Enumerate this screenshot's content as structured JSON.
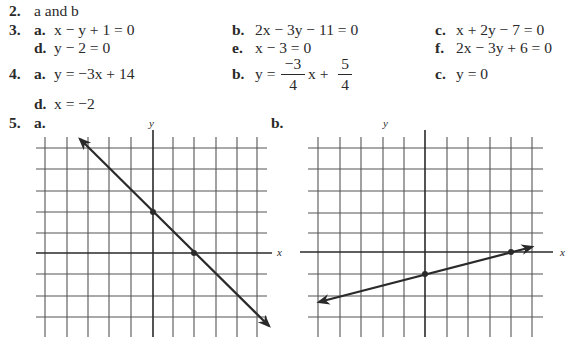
{
  "answers": {
    "q2": {
      "number": "2.",
      "text": "a and b"
    },
    "q3": {
      "number": "3.",
      "items": [
        {
          "label": "a.",
          "eq": "x − y + 1 = 0"
        },
        {
          "label": "b.",
          "eq": "2x − 3y − 11 = 0"
        },
        {
          "label": "c.",
          "eq": "x + 2y − 7 = 0"
        },
        {
          "label": "d.",
          "eq": "y − 2 = 0"
        },
        {
          "label": "e.",
          "eq": "x − 3 = 0"
        },
        {
          "label": "f.",
          "eq": "2x − 3y + 6 = 0"
        }
      ]
    },
    "q4": {
      "number": "4.",
      "a": {
        "label": "a.",
        "eq": "y = −3x + 14"
      },
      "b": {
        "label": "b.",
        "lhs": "y =",
        "frac1_num": "−3",
        "frac1_den": "4",
        "mid": "x +",
        "frac2_num": "5",
        "frac2_den": "4"
      },
      "c": {
        "label": "c.",
        "eq": "y = 0"
      },
      "d": {
        "label": "d.",
        "eq": "x = −2"
      }
    },
    "q5": {
      "number": "5.",
      "graph_a": {
        "label": "a.",
        "x_axis": "x",
        "y_axis": "y",
        "line": "y = −x + 2",
        "points": [
          [
            0,
            2
          ],
          [
            2,
            0
          ]
        ]
      },
      "graph_b": {
        "label": "b.",
        "x_axis": "x",
        "y_axis": "y",
        "line": "y = x/4 − 1",
        "points": [
          [
            0,
            -1
          ],
          [
            4,
            0
          ]
        ]
      }
    }
  }
}
